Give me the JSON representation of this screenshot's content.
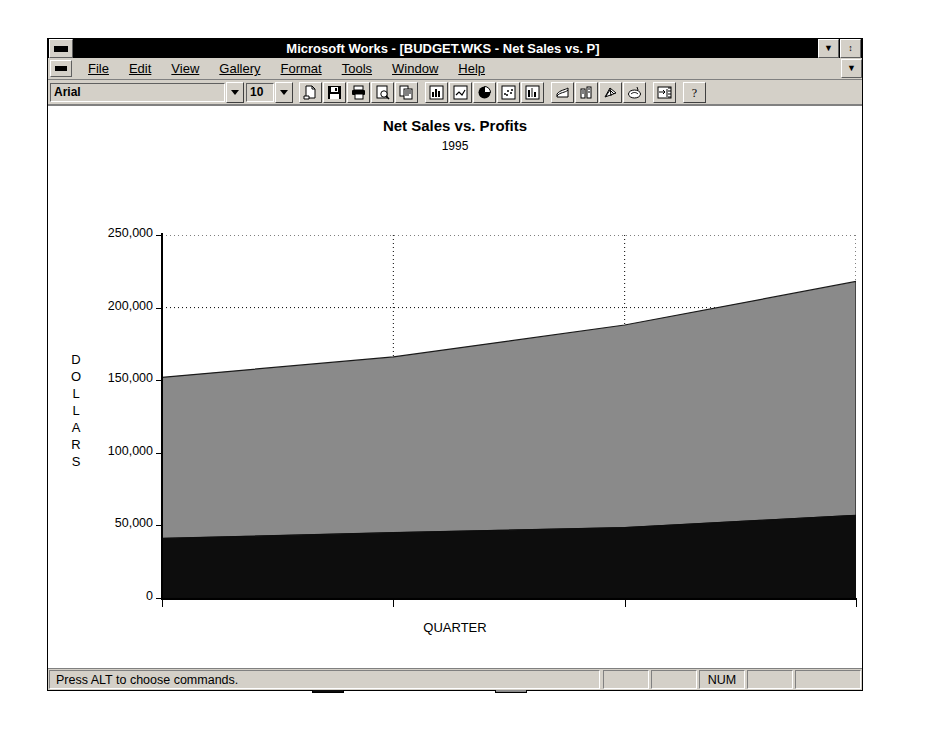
{
  "window": {
    "title": "Microsoft Works - [BUDGET.WKS - Net Sales vs. P]",
    "system_menu_icon": "window-menu-icon",
    "minimize_label": "▼",
    "restore_label": "↕"
  },
  "menubar": {
    "document_menu_icon": "document-menu-icon",
    "items": [
      {
        "label": "File",
        "accel": "F"
      },
      {
        "label": "Edit",
        "accel": "E"
      },
      {
        "label": "View",
        "accel": "V"
      },
      {
        "label": "Gallery",
        "accel": "G"
      },
      {
        "label": "Format",
        "accel": "t"
      },
      {
        "label": "Tools",
        "accel": "o"
      },
      {
        "label": "Window",
        "accel": "W"
      },
      {
        "label": "Help",
        "accel": "H"
      }
    ],
    "scroll_up_label": "▲",
    "scroll_down_label": "▼"
  },
  "toolbar": {
    "font_name": "Arial",
    "font_size": "10",
    "font_dropdown_icon": "chevron-down-icon",
    "size_dropdown_icon": "chevron-down-icon",
    "buttons": [
      {
        "icon": "new-document-icon"
      },
      {
        "icon": "save-icon"
      },
      {
        "icon": "print-icon"
      },
      {
        "icon": "print-preview-icon"
      },
      {
        "icon": "copy-icon"
      },
      {
        "icon": "bar-chart-icon"
      },
      {
        "icon": "line-chart-icon"
      },
      {
        "icon": "pie-chart-icon"
      },
      {
        "icon": "scatter-chart-icon"
      },
      {
        "icon": "stacked-bar-chart-icon"
      },
      {
        "icon": "area-chart-icon"
      },
      {
        "icon": "3d-bar-chart-icon"
      },
      {
        "icon": "radar-chart-icon"
      },
      {
        "icon": "combo-chart-icon"
      },
      {
        "icon": "first-chart-icon"
      },
      {
        "icon": "help-icon"
      }
    ]
  },
  "chart_data": {
    "type": "area",
    "title": "Net Sales vs. Profits",
    "subtitle": "1995",
    "xlabel": "QUARTER",
    "ylabel": "DOLLARS",
    "ylabel_letters": [
      "D",
      "O",
      "L",
      "L",
      "A",
      "R",
      "S"
    ],
    "categories": [
      "Q1",
      "Q2",
      "Q3",
      "Q4"
    ],
    "x": [
      0,
      1,
      2,
      3
    ],
    "ylim": [
      0,
      250000
    ],
    "yticks": [
      0,
      50000,
      100000,
      150000,
      200000,
      250000
    ],
    "ytick_labels": [
      "0",
      "50,000",
      "100,000",
      "150,000",
      "200,000",
      "250,000"
    ],
    "grid": "horizontal-and-vertical-dotted",
    "legend_position": "bottom",
    "stacked": true,
    "series": [
      {
        "name": "Gross Profits",
        "color": "#0d0d0d",
        "values": [
          41000,
          45000,
          48500,
          57000
        ]
      },
      {
        "name": "Net Sales",
        "color": "#8a8a8a",
        "values": [
          111000,
          121000,
          139500,
          161000
        ],
        "cumulative_top": [
          152000,
          166000,
          188000,
          218000
        ]
      }
    ]
  },
  "statusbar": {
    "message": "Press ALT to choose commands.",
    "panels": [
      "",
      "",
      "NUM",
      "",
      ""
    ]
  }
}
